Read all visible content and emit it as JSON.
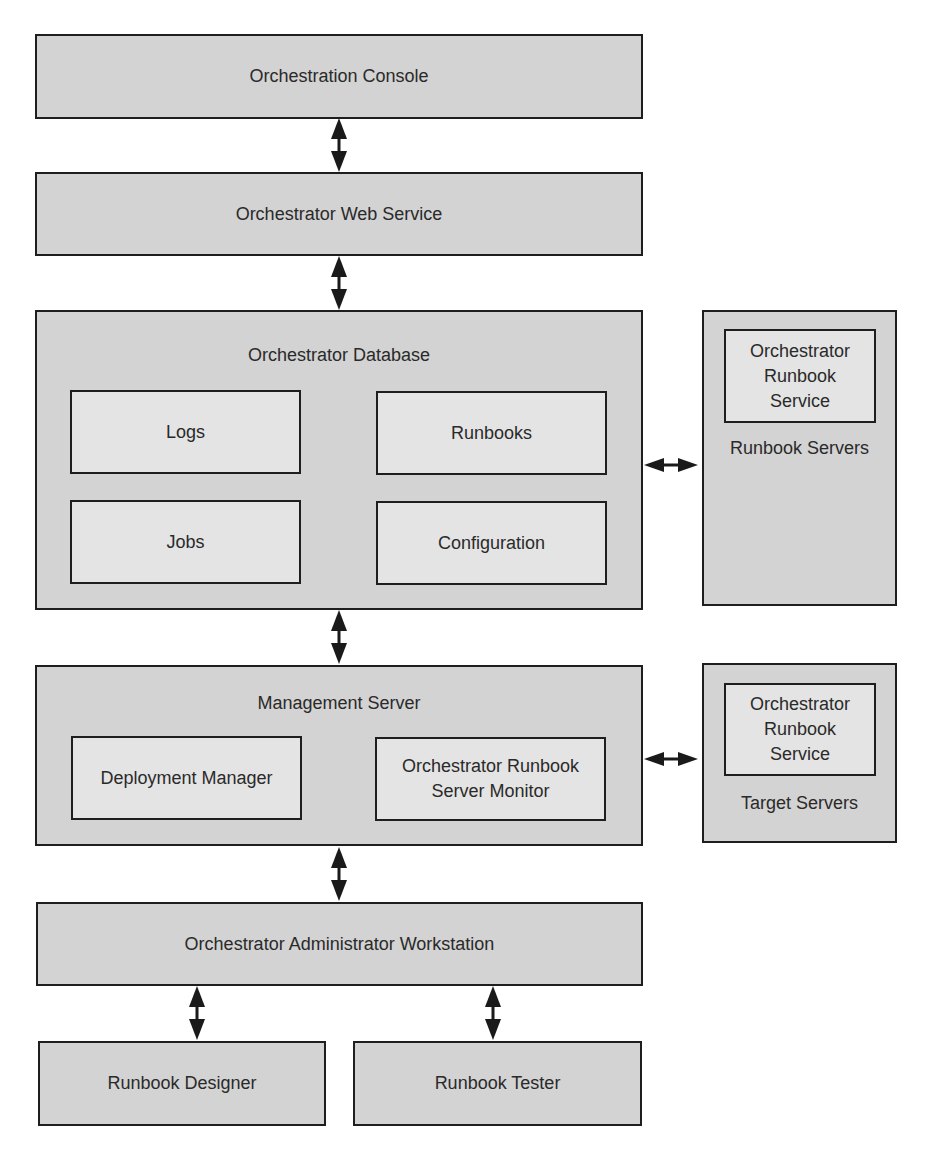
{
  "diagram": {
    "console": {
      "label": "Orchestration Console"
    },
    "web_service": {
      "label": "Orchestrator Web Service"
    },
    "database": {
      "label": "Orchestrator Database",
      "components": [
        {
          "label": "Logs"
        },
        {
          "label": "Runbooks"
        },
        {
          "label": "Jobs"
        },
        {
          "label": "Configuration"
        }
      ]
    },
    "runbook_servers": {
      "label": "Runbook Servers",
      "service": {
        "label": "Orchestrator\nRunbook\nService"
      }
    },
    "management_server": {
      "label": "Management Server",
      "components": [
        {
          "label": "Deployment Manager"
        },
        {
          "label": "Orchestrator Runbook\nServer Monitor"
        }
      ]
    },
    "target_servers": {
      "label": "Target Servers",
      "service": {
        "label": "Orchestrator\nRunbook\nService"
      }
    },
    "admin_workstation": {
      "label": "Orchestrator Administrator Workstation"
    },
    "runbook_designer": {
      "label": "Runbook Designer"
    },
    "runbook_tester": {
      "label": "Runbook Tester"
    },
    "colors": {
      "box_fill": "#d3d3d3",
      "inner_fill": "#e4e4e4",
      "border": "#1e1e1e",
      "arrow": "#1a1a1a"
    }
  }
}
